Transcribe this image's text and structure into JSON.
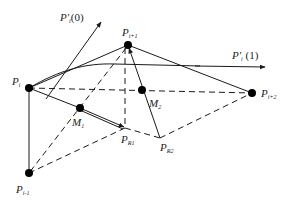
{
  "diagram": {
    "colors": {
      "line": "#1a1a1a",
      "point": "#000000",
      "background": "#ffffff"
    },
    "points": {
      "P_i": {
        "label": "P",
        "sub": "i",
        "x": 29,
        "y": 88
      },
      "P_i1": {
        "label": "P",
        "sub": "i+1",
        "x": 128,
        "y": 45
      },
      "P_i2": {
        "label": "P",
        "sub": "i+2",
        "x": 252,
        "y": 93
      },
      "P_im1": {
        "label": "P",
        "sub": "i-1",
        "x": 29,
        "y": 173
      },
      "M_1": {
        "label": "M",
        "sub": "1",
        "x": 80,
        "y": 108
      },
      "M_2": {
        "label": "M",
        "sub": "2",
        "x": 142,
        "y": 90
      },
      "P_R1": {
        "label": "P",
        "sub": "R1",
        "x": 125,
        "y": 128
      },
      "P_R2": {
        "label": "P",
        "sub": "R2",
        "x": 160,
        "y": 138
      }
    },
    "tangents": {
      "start": {
        "label": "P'",
        "sub": "i",
        "arg": "(0)"
      },
      "end": {
        "label": "P'",
        "sub": "i",
        "arg": "(1)"
      }
    }
  }
}
